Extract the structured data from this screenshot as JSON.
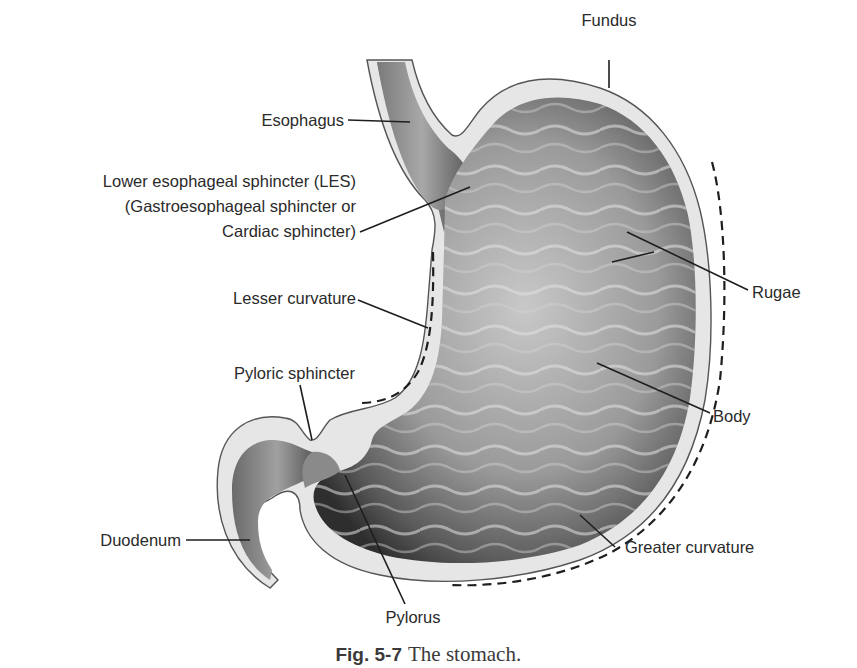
{
  "figure": {
    "title": "The stomach",
    "caption": {
      "number": "Fig. 5-7",
      "text": "The stomach."
    },
    "colors": {
      "background": "#ffffff",
      "wall": "#e6e6e6",
      "lumen_light": "#bdbdbd",
      "lumen_dark": "#3c3c3c",
      "label_text": "#2a2a2a",
      "leader_lines": "#1e1e1e"
    }
  },
  "labels": {
    "fundus": "Fundus",
    "esophagus": "Esophagus",
    "les_line1": "Lower esophageal sphincter (LES)",
    "les_line2": "(Gastroesophageal sphincter or",
    "les_line3": "Cardiac sphincter)",
    "lesser_curvature": "Lesser curvature",
    "pyloric_sphincter": "Pyloric sphincter",
    "rugae": "Rugae",
    "body": "Body",
    "duodenum": "Duodenum",
    "greater_curvature": "Greater curvature",
    "pylorus": "Pylorus"
  }
}
